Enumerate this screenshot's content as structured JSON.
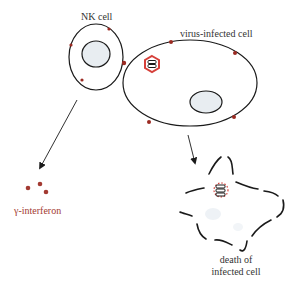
{
  "labels": {
    "nk_cell": "NK cell",
    "virus_infected_cell": "virus-infected cell",
    "gamma_interferon": "γ-interferon",
    "death_line1": "death of",
    "death_line2": "infected cell"
  },
  "colors": {
    "outline": "#1a1a1a",
    "nucleus_fill": "#e8edf1",
    "receptor": "#9b2a22",
    "virus": "#d6403a",
    "interferon": "#a33a32",
    "label_text": "#333333"
  }
}
